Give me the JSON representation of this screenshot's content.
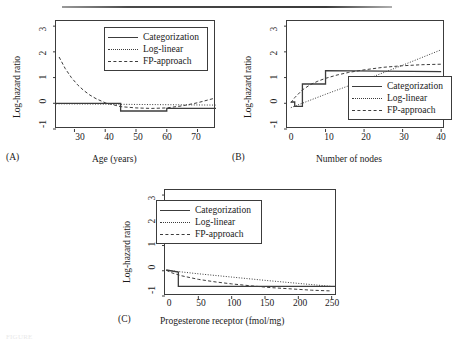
{
  "figure": {
    "caption_faint": "FIGURE",
    "legend_labels": {
      "categorization": "Categorization",
      "log_linear": "Log-linear",
      "fp_approach": "FP-approach"
    },
    "shared_ylabel": "Log-hazard ratio",
    "shared_yticks": [
      "-1",
      "0",
      "1",
      "2",
      "3"
    ]
  },
  "chart_data": [
    {
      "type": "line",
      "panel": "A",
      "panel_tag": "(A)",
      "title": "",
      "xlabel": "Age (years)",
      "ylabel": "Log-hazard ratio",
      "xlim": [
        24,
        76
      ],
      "ylim": [
        -1,
        3.2
      ],
      "xticks": [
        30,
        40,
        50,
        60,
        70
      ],
      "yticks": [
        -1,
        0,
        1,
        2,
        3
      ],
      "grid": false,
      "legend_position": "top-right",
      "series": [
        {
          "name": "Categorization",
          "style": "solid",
          "step": true,
          "x": [
            24,
            45,
            45,
            60,
            60,
            76
          ],
          "y": [
            0.0,
            0.0,
            -0.3,
            -0.3,
            -0.2,
            -0.2
          ]
        },
        {
          "name": "Log-linear",
          "style": "dotted",
          "x": [
            24,
            35,
            45,
            55,
            65,
            76
          ],
          "y": [
            -0.02,
            -0.03,
            -0.04,
            -0.05,
            -0.06,
            -0.07
          ]
        },
        {
          "name": "FP-approach",
          "style": "dashed",
          "x": [
            25,
            27,
            29,
            31,
            33,
            35,
            37,
            40,
            45,
            50,
            55,
            60,
            65,
            70,
            75
          ],
          "y": [
            1.8,
            1.35,
            1.0,
            0.72,
            0.5,
            0.32,
            0.18,
            0.02,
            -0.13,
            -0.18,
            -0.2,
            -0.18,
            -0.1,
            0.02,
            0.18
          ]
        }
      ]
    },
    {
      "type": "line",
      "panel": "B",
      "panel_tag": "(B)",
      "title": "",
      "xlabel": "Number of nodes",
      "ylabel": "Log-hazard ratio",
      "xlim": [
        0,
        41
      ],
      "ylim": [
        -1,
        3.2
      ],
      "xticks": [
        0,
        10,
        20,
        30,
        40
      ],
      "yticks": [
        -1,
        0,
        1,
        2,
        3
      ],
      "grid": false,
      "legend_position": "bottom-right",
      "series": [
        {
          "name": "Categorization",
          "style": "solid",
          "step": true,
          "x": [
            1,
            2,
            2,
            4,
            4,
            10,
            10,
            40
          ],
          "y": [
            0.05,
            0.05,
            -0.12,
            -0.12,
            0.75,
            0.75,
            1.27,
            1.23
          ]
        },
        {
          "name": "Log-linear",
          "style": "dotted",
          "x": [
            1,
            10,
            20,
            30,
            40
          ],
          "y": [
            -0.17,
            0.35,
            0.9,
            1.48,
            2.08
          ]
        },
        {
          "name": "FP-approach",
          "style": "dashed",
          "x": [
            1,
            2,
            4,
            6,
            8,
            10,
            13,
            16,
            20,
            25,
            30,
            35,
            40
          ],
          "y": [
            0.02,
            0.22,
            0.52,
            0.72,
            0.86,
            0.97,
            1.1,
            1.2,
            1.3,
            1.4,
            1.46,
            1.5,
            1.52
          ]
        }
      ]
    },
    {
      "type": "line",
      "panel": "C",
      "panel_tag": "(C)",
      "title": "",
      "xlabel": "Progesterone receptor (fmol/mg)",
      "ylabel": "Log-hazard ratio",
      "xlim": [
        0,
        258
      ],
      "ylim": [
        -1,
        3.2
      ],
      "xticks": [
        0,
        50,
        100,
        150,
        200,
        250
      ],
      "yticks": [
        -1,
        0,
        1,
        2,
        3
      ],
      "grid": false,
      "legend_position": "top-center",
      "series": [
        {
          "name": "Categorization",
          "style": "solid",
          "step": true,
          "x": [
            2,
            20,
            20,
            255
          ],
          "y": [
            0.03,
            -0.05,
            -0.62,
            -0.62
          ]
        },
        {
          "name": "Log-linear",
          "style": "dotted",
          "x": [
            2,
            50,
            100,
            150,
            200,
            250
          ],
          "y": [
            0.02,
            -0.12,
            -0.25,
            -0.38,
            -0.5,
            -0.62
          ]
        },
        {
          "name": "FP-approach",
          "style": "dashed",
          "x": [
            2,
            10,
            25,
            50,
            75,
            100,
            130,
            160,
            190,
            220,
            250
          ],
          "y": [
            0.02,
            -0.08,
            -0.2,
            -0.34,
            -0.44,
            -0.52,
            -0.6,
            -0.67,
            -0.72,
            -0.77,
            -0.8
          ]
        }
      ]
    }
  ],
  "panel_a": {
    "tag": "(A)",
    "xlabel": "Age (years)",
    "ylabel": "Log-hazard ratio",
    "xticks": [
      "30",
      "40",
      "50",
      "60",
      "70"
    ],
    "yticks": [
      "-1",
      "0",
      "1",
      "2",
      "3"
    ]
  },
  "panel_b": {
    "tag": "(B)",
    "xlabel": "Number of nodes",
    "ylabel": "Log-hazard ratio",
    "xticks": [
      "0",
      "10",
      "20",
      "30",
      "40"
    ],
    "yticks": [
      "-1",
      "0",
      "1",
      "2",
      "3"
    ]
  },
  "panel_c": {
    "tag": "(C)",
    "xlabel": "Progesterone receptor (fmol/mg)",
    "ylabel": "Log-hazard ratio",
    "xticks": [
      "0",
      "50",
      "100",
      "150",
      "200",
      "250"
    ],
    "yticks": [
      "-1",
      "0",
      "1",
      "2",
      "3"
    ]
  }
}
